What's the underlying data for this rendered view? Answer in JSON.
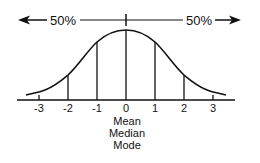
{
  "diagram": {
    "left_percent": "50%",
    "right_percent": "50%",
    "axis_ticks": [
      {
        "value": -3,
        "label": "-3"
      },
      {
        "value": -2,
        "label": "-2"
      },
      {
        "value": -1,
        "label": "-1"
      },
      {
        "value": 0,
        "label": "0"
      },
      {
        "value": 1,
        "label": "1"
      },
      {
        "value": 2,
        "label": "2"
      },
      {
        "value": 3,
        "label": "3"
      }
    ],
    "center_labels": [
      "Mean",
      "Median",
      "Mode"
    ],
    "colors": {
      "stroke": "#111111",
      "background": "#ffffff"
    }
  }
}
